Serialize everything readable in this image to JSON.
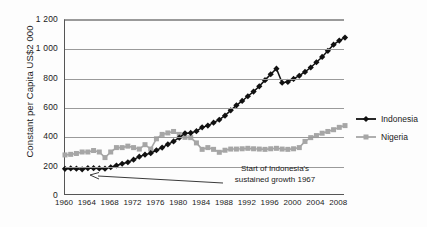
{
  "chart_data": {
    "type": "line",
    "title": "",
    "xlabel": "",
    "ylabel": "Constant per Capita US$2 000",
    "xlim": [
      1960,
      2009
    ],
    "ylim": [
      0,
      1200
    ],
    "grid": true,
    "legend_position": "right",
    "y_ticks": [
      0,
      200,
      400,
      600,
      800,
      1000,
      1200
    ],
    "y_tick_labels": [
      "0",
      "200",
      "400",
      "600",
      "800",
      "1 000",
      "1 200"
    ],
    "x_tick_labels": [
      "1960",
      "1964",
      "1968",
      "1972",
      "1976",
      "1980",
      "1984",
      "1988",
      "1992",
      "1996",
      "2000",
      "2004",
      "2008"
    ],
    "x": [
      1960,
      1961,
      1962,
      1963,
      1964,
      1965,
      1966,
      1967,
      1968,
      1969,
      1970,
      1971,
      1972,
      1973,
      1974,
      1975,
      1976,
      1977,
      1978,
      1979,
      1980,
      1981,
      1982,
      1983,
      1984,
      1985,
      1986,
      1987,
      1988,
      1989,
      1990,
      1991,
      1992,
      1993,
      1994,
      1995,
      1996,
      1997,
      1998,
      1999,
      2000,
      2001,
      2002,
      2003,
      2004,
      2005,
      2006,
      2007,
      2008,
      2009
    ],
    "series": [
      {
        "name": "Indonesia",
        "color": "#111111",
        "marker": "diamond",
        "values": [
          185,
          188,
          186,
          182,
          190,
          190,
          188,
          186,
          196,
          208,
          220,
          230,
          248,
          268,
          282,
          292,
          312,
          330,
          352,
          372,
          398,
          428,
          430,
          442,
          468,
          480,
          500,
          520,
          548,
          584,
          618,
          648,
          680,
          712,
          748,
          790,
          830,
          868,
          772,
          778,
          798,
          820,
          846,
          876,
          912,
          948,
          990,
          1032,
          1060,
          1080
        ]
      },
      {
        "name": "Nigeria",
        "color": "#a6a6a6",
        "marker": "square",
        "values": [
          280,
          284,
          290,
          300,
          300,
          310,
          300,
          262,
          300,
          330,
          330,
          340,
          330,
          320,
          350,
          320,
          390,
          420,
          430,
          440,
          420,
          400,
          398,
          362,
          318,
          330,
          318,
          298,
          312,
          320,
          320,
          322,
          325,
          322,
          320,
          318,
          322,
          325,
          320,
          318,
          322,
          330,
          372,
          398,
          412,
          428,
          440,
          452,
          468,
          480
        ]
      }
    ],
    "annotations": [
      {
        "text_line1": "Start of Indonesia's",
        "text_line2": "sustained growth 1967",
        "points_to_year": 1967
      }
    ]
  }
}
